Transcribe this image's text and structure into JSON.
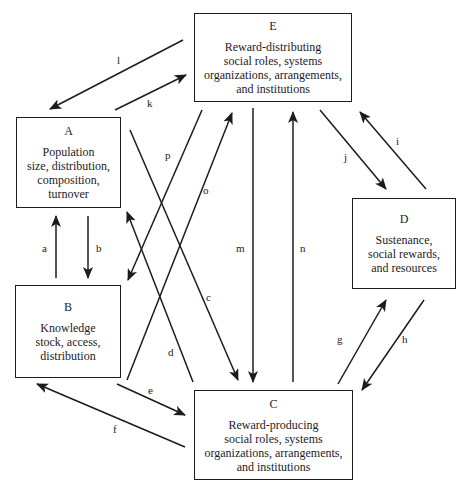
{
  "boxes": {
    "A": {
      "letter": "A",
      "lines": [
        "Population",
        "size, distribution,",
        "composition,",
        "turnover"
      ]
    },
    "B": {
      "letter": "B",
      "lines": [
        "Knowledge",
        "stock, access,",
        "distribution"
      ]
    },
    "C": {
      "letter": "C",
      "lines": [
        "Reward-producing",
        "social roles, systems",
        "organizations, arrangements,",
        "and institutions"
      ]
    },
    "D": {
      "letter": "D",
      "lines": [
        "Sustenance,",
        "social rewards,",
        "and resources"
      ]
    },
    "E": {
      "letter": "E",
      "lines": [
        "Reward-distributing",
        "social roles, systems",
        "organizations, arrangements,",
        "and institutions"
      ]
    }
  },
  "arrows": [
    {
      "label": "a",
      "from": "B",
      "to": "A"
    },
    {
      "label": "b",
      "from": "A",
      "to": "B"
    },
    {
      "label": "c",
      "from": "A",
      "to": "C"
    },
    {
      "label": "d",
      "from": "C",
      "to": "A"
    },
    {
      "label": "e",
      "from": "B",
      "to": "C"
    },
    {
      "label": "f",
      "from": "C",
      "to": "B"
    },
    {
      "label": "g",
      "from": "C",
      "to": "D"
    },
    {
      "label": "h",
      "from": "D",
      "to": "C"
    },
    {
      "label": "i",
      "from": "D",
      "to": "E"
    },
    {
      "label": "j",
      "from": "E",
      "to": "D"
    },
    {
      "label": "k",
      "from": "A",
      "to": "E"
    },
    {
      "label": "l",
      "from": "E",
      "to": "A"
    },
    {
      "label": "m",
      "from": "E",
      "to": "C"
    },
    {
      "label": "n",
      "from": "C",
      "to": "E"
    },
    {
      "label": "o",
      "from": "B",
      "to": "E"
    },
    {
      "label": "p",
      "from": "E",
      "to": "B"
    }
  ],
  "colors": {
    "ink": "#1c1c1c",
    "background": "#ffffff"
  }
}
